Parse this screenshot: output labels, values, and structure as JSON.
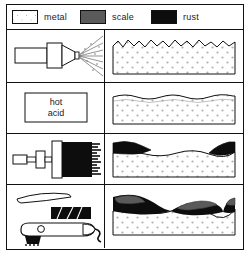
{
  "figure": {
    "colors": {
      "line": "#111111",
      "metal_fill": "#ffffff",
      "metal_dot": "#b0b0b0",
      "scale": "#5a5a5a",
      "rust": "#0d0d0d",
      "background": "#ffffff"
    }
  },
  "legend": {
    "items": [
      {
        "label": "metal",
        "swatch": "white-stippled",
        "color": "#ffffff",
        "icon": "metal-swatch-icon"
      },
      {
        "label": "scale",
        "swatch": "solid-gray",
        "color": "#5a5a5a",
        "icon": "scale-swatch-icon"
      },
      {
        "label": "rust",
        "swatch": "solid-black",
        "color": "#0d0d0d",
        "icon": "rust-swatch-icon"
      }
    ]
  },
  "rows": [
    {
      "id": "abrasive-blasting",
      "tool": {
        "name": "spray-nozzle",
        "label": "",
        "icon": "spray-nozzle-icon"
      },
      "result": {
        "name": "rough-profile-metal",
        "surface": "jagged",
        "layers": [
          "metal"
        ],
        "scale_present": false,
        "rust_present": false
      }
    },
    {
      "id": "acid-pickling",
      "tool": {
        "name": "acid-bath",
        "label": "hot\nacid",
        "label_line1": "hot",
        "label_line2": "acid",
        "icon": "acid-tank-icon"
      },
      "result": {
        "name": "smooth-wavy-metal",
        "surface": "wavy",
        "layers": [
          "metal"
        ],
        "scale_present": false,
        "rust_present": false
      }
    },
    {
      "id": "wire-brushing",
      "tool": {
        "name": "wire-brush",
        "label": "",
        "icon": "wire-brush-icon"
      },
      "result": {
        "name": "partially-cleaned-metal",
        "surface": "wavy",
        "layers": [
          "metal",
          "rust"
        ],
        "scale_present": false,
        "rust_present": true
      }
    },
    {
      "id": "power-tool-grinding",
      "tool": {
        "name": "power-grinder",
        "label": "",
        "icon": "power-grinder-icon"
      },
      "result": {
        "name": "scale-and-rust-remnants-metal",
        "surface": "wavy",
        "layers": [
          "metal",
          "scale",
          "rust"
        ],
        "scale_present": true,
        "rust_present": true
      }
    }
  ]
}
